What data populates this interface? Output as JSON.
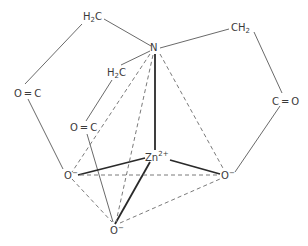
{
  "diagram": {
    "atoms": {
      "n": {
        "text": "N"
      },
      "zn": {
        "text": "Zn",
        "charge": "2+"
      },
      "ch2_top_left": {
        "pre": "H",
        "sub": "2",
        "post": "C"
      },
      "ch2_top_right": {
        "pre": "CH",
        "sub": "2"
      },
      "ch2_inner": {
        "pre": "H",
        "sub": "2",
        "post": "C"
      },
      "co_left": {
        "text": "O = C"
      },
      "co_middle": {
        "text": "O = C"
      },
      "co_right": {
        "text": "C = O"
      },
      "o_left": {
        "text": "O",
        "charge": "−"
      },
      "o_right": {
        "text": "O",
        "charge": "−"
      },
      "o_bottom": {
        "text": "O",
        "charge": "−"
      }
    },
    "colors": {
      "bond_thin": "#6a6a6a",
      "bond_bold": "#2a2a2a",
      "bond_dashed": "#7a7a7a",
      "text": "#3a3a3a"
    }
  }
}
